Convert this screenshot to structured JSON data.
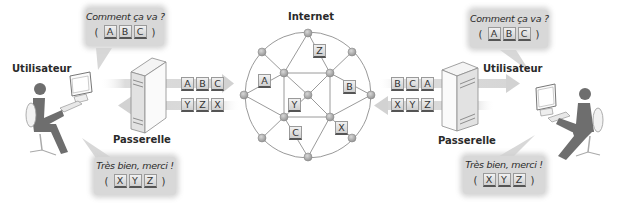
{
  "title": "Internet",
  "left": {
    "user_label": "Utilisateur",
    "gateway_label": "Passerelle",
    "bubble_question": {
      "text": "Comment ça va ?",
      "letters": [
        "A",
        "B",
        "C"
      ],
      "open": "(",
      "close": ")"
    },
    "bubble_answer": {
      "text": "Très bien, merci !",
      "letters": [
        "X",
        "Y",
        "Z"
      ],
      "open": "(",
      "close": ")"
    },
    "outgoing_packets": [
      "A",
      "B",
      "C"
    ],
    "incoming_packets": [
      "Y",
      "Z",
      "X"
    ]
  },
  "right": {
    "user_label": "Utilisateur",
    "gateway_label": "Passerelle",
    "bubble_question": {
      "text": "Comment ça va ?",
      "letters": [
        "A",
        "B",
        "C"
      ],
      "open": "(",
      "close": ")"
    },
    "bubble_answer": {
      "text": "Très bien, merci !",
      "letters": [
        "X",
        "Y",
        "Z"
      ],
      "open": "(",
      "close": ")"
    },
    "incoming_packets": [
      "B",
      "C",
      "A"
    ],
    "outgoing_packets": [
      "X",
      "Y",
      "Z"
    ]
  },
  "network": {
    "packets_in_transit": [
      {
        "letter": "Z",
        "x": 313,
        "y": 44
      },
      {
        "letter": "A",
        "x": 258,
        "y": 74
      },
      {
        "letter": "B",
        "x": 343,
        "y": 80
      },
      {
        "letter": "Y",
        "x": 288,
        "y": 98
      },
      {
        "letter": "C",
        "x": 289,
        "y": 126
      },
      {
        "letter": "X",
        "x": 335,
        "y": 121
      }
    ]
  },
  "colors": {
    "node": "#a8a8a8",
    "line": "#8e8e8e",
    "band": "#dcdcdc",
    "person": "#6e6e6e",
    "bubble": "#d8d8d8"
  }
}
